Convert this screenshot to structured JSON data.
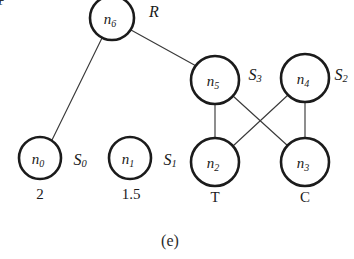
{
  "figure": {
    "caption": "(e)",
    "background_color": "#ffffff",
    "node_stroke_color": "#1b1b1b",
    "edge_stroke_color": "#3a3a3a",
    "text_color": "#1a1a1a",
    "width": 354,
    "height": 259
  },
  "nodes": [
    {
      "id": "n6",
      "base": "n",
      "subscript": "6",
      "cx": 112,
      "cy": 18,
      "r": 22,
      "side_label": {
        "base": "R",
        "subscript": "",
        "x": 154,
        "y": 11
      },
      "value_label": null
    },
    {
      "id": "n5",
      "base": "n",
      "subscript": "5",
      "cx": 215,
      "cy": 80,
      "r": 24,
      "side_label": {
        "base": "S",
        "subscript": "3",
        "x": 255,
        "y": 74
      },
      "value_label": null
    },
    {
      "id": "n4",
      "base": "n",
      "subscript": "4",
      "cx": 305,
      "cy": 78,
      "r": 24,
      "side_label": {
        "base": "S",
        "subscript": "2",
        "x": 341,
        "y": 74
      },
      "value_label": null
    },
    {
      "id": "n0",
      "base": "n",
      "subscript": "0",
      "cx": 40,
      "cy": 158,
      "r": 21,
      "side_label": {
        "base": "S",
        "subscript": "0",
        "x": 80,
        "y": 159
      },
      "value_label": {
        "text": "2",
        "x": 40,
        "y": 194
      }
    },
    {
      "id": "n1",
      "base": "n",
      "subscript": "1",
      "cx": 130,
      "cy": 158,
      "r": 21,
      "side_label": {
        "base": "S",
        "subscript": "1",
        "x": 170,
        "y": 159
      },
      "value_label": {
        "text": "1.5",
        "x": 131,
        "y": 194
      }
    },
    {
      "id": "n2",
      "base": "n",
      "subscript": "2",
      "cx": 215,
      "cy": 162,
      "r": 24,
      "side_label": null,
      "value_label": {
        "text": "T",
        "x": 215,
        "y": 197,
        "italic": true
      }
    },
    {
      "id": "n3",
      "base": "n",
      "subscript": "3",
      "cx": 305,
      "cy": 162,
      "r": 24,
      "side_label": null,
      "value_label": {
        "text": "C",
        "x": 305,
        "y": 197,
        "italic": true
      }
    }
  ],
  "edges": [
    {
      "id": "e-n6-n0",
      "from": "n6",
      "to": "n0",
      "x1": 102,
      "y1": 38,
      "x2": 52,
      "y2": 140
    },
    {
      "id": "e-n6-n5",
      "from": "n6",
      "to": "n5",
      "x1": 131,
      "y1": 30,
      "x2": 198,
      "y2": 67
    },
    {
      "id": "e-n5-n2",
      "from": "n5",
      "to": "n2",
      "x1": 215,
      "y1": 104,
      "x2": 215,
      "y2": 138
    },
    {
      "id": "e-n4-n3",
      "from": "n4",
      "to": "n3",
      "x1": 305,
      "y1": 102,
      "x2": 305,
      "y2": 138
    },
    {
      "id": "e-n5-n3",
      "from": "n5",
      "to": "n3",
      "x1": 233,
      "y1": 96,
      "x2": 288,
      "y2": 146
    },
    {
      "id": "e-n4-n2",
      "from": "n4",
      "to": "n2",
      "x1": 288,
      "y1": 95,
      "x2": 233,
      "y2": 146
    }
  ],
  "edge_labels": [
    {
      "id": "label-one",
      "text": "1",
      "x": 120,
      "y": 52,
      "style": "italic"
    },
    {
      "id": "label-plus",
      "text": "+",
      "x": 232,
      "y": 110,
      "style": "normal"
    },
    {
      "id": "label-minus",
      "text": "−",
      "x": 289,
      "y": 108,
      "style": "normal"
    }
  ],
  "caption": {
    "text": "(e)",
    "x": 170,
    "y": 240
  }
}
